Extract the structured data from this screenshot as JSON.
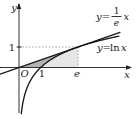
{
  "labels": {
    "y_axis": "y",
    "x_axis": "x",
    "origin": "O",
    "x_tick_one": "1",
    "x_tick_e": "e",
    "y_tick_one": "1",
    "line_label_prefix": "y=",
    "line_label_numerator": "1",
    "line_label_denominator": "e",
    "line_label_suffix": "x",
    "curve_label_prefix": "y=",
    "curve_label_fn": "ln",
    "curve_label_var": "x"
  },
  "curves": [
    {
      "name": "tangent-line",
      "equation_label": "y=(1/e)x"
    },
    {
      "name": "ln-curve",
      "equation_label": "y=ln x"
    }
  ],
  "plot": {
    "origin_px": [
      19,
      67.5
    ],
    "unit_px": [
      21.7,
      20.5
    ],
    "e": 2.71828,
    "curve_x_range": [
      0.105,
      4.6
    ],
    "line_px_range": [
      0,
      120
    ],
    "axis": {
      "x_start": 0,
      "x_end": 131,
      "y_top": 4,
      "y_bottom": 113
    },
    "colors": {
      "dark_region": "#b2b2b2",
      "light_region": "#e6e6e6",
      "stroke": "#1c1c1c",
      "dashed": "#8a8a8a",
      "background": "#ffffff"
    }
  }
}
